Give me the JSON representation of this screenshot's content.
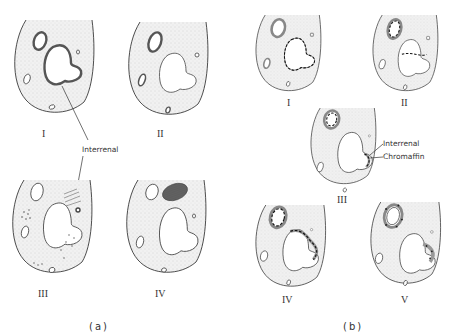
{
  "figure": {
    "panel_a": {
      "caption": "(a)",
      "sections": [
        {
          "numeral": "I"
        },
        {
          "numeral": "II"
        },
        {
          "numeral": "III"
        },
        {
          "numeral": "IV"
        }
      ],
      "annotation": "Interrenal"
    },
    "panel_b": {
      "caption": "(b)",
      "sections": [
        {
          "numeral": "I"
        },
        {
          "numeral": "II"
        },
        {
          "numeral": "III"
        },
        {
          "numeral": "IV"
        },
        {
          "numeral": "V"
        }
      ],
      "annotations": [
        "Interrenal",
        "Chromaffin"
      ]
    }
  },
  "colors": {
    "stroke": "#3a3a3a",
    "stipple": "#d8d8d8",
    "dense_tissue": "#555555"
  }
}
